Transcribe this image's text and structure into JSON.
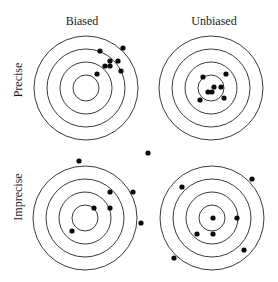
{
  "figure": {
    "column_labels": [
      "Biased",
      "Unbiased"
    ],
    "row_labels": [
      "Precise",
      "Imprecise"
    ],
    "ring_radii": [
      52,
      39,
      26,
      13
    ],
    "shot_radius": 2.6,
    "ink_color": "#0a0a0a",
    "ring_color": "#3a3a3a"
  },
  "targets": [
    {
      "name": "precise-biased",
      "column": "Biased",
      "row": "Precise",
      "center": [
        86,
        88
      ],
      "shots": [
        [
          100,
          51
        ],
        [
          123,
          48
        ],
        [
          110,
          61
        ],
        [
          118,
          61
        ],
        [
          105,
          66
        ],
        [
          110,
          66
        ],
        [
          121,
          71
        ],
        [
          97,
          74
        ]
      ]
    },
    {
      "name": "precise-unbiased",
      "column": "Unbiased",
      "row": "Precise",
      "center": [
        211,
        88
      ],
      "shots": [
        [
          203,
          77
        ],
        [
          226,
          74
        ],
        [
          214,
          87
        ],
        [
          221,
          87
        ],
        [
          208,
          92
        ],
        [
          212,
          92
        ],
        [
          224,
          98
        ],
        [
          200,
          100
        ]
      ]
    },
    {
      "name": "imprecise-biased",
      "column": "Biased",
      "row": "Imprecise",
      "center": [
        85,
        218
      ],
      "shots": [
        [
          79,
          161
        ],
        [
          148,
          153
        ],
        [
          110,
          192
        ],
        [
          133,
          192
        ],
        [
          94,
          208
        ],
        [
          110,
          208
        ],
        [
          141,
          223
        ],
        [
          72,
          231
        ]
      ]
    },
    {
      "name": "imprecise-unbiased",
      "column": "Unbiased",
      "row": "Imprecise",
      "center": [
        212,
        218
      ],
      "shots": [
        [
          252,
          179
        ],
        [
          182,
          187
        ],
        [
          213,
          218
        ],
        [
          237,
          218
        ],
        [
          197,
          234
        ],
        [
          213,
          234
        ],
        [
          244,
          250
        ],
        [
          174,
          258
        ]
      ]
    }
  ]
}
